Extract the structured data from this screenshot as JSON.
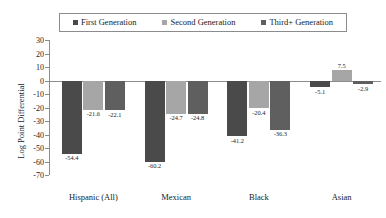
{
  "chart_data": {
    "type": "bar",
    "title": "",
    "xlabel": "",
    "ylabel": "Log Point Differential",
    "ylim": [
      -70,
      30
    ],
    "ytick_step": 10,
    "yticks": [
      30,
      20,
      10,
      0,
      -10,
      -20,
      -30,
      -40,
      -50,
      -60,
      -70
    ],
    "ytick_labels": [
      "30",
      "20",
      "10",
      "0",
      "-10",
      "-20",
      "-30",
      "-40",
      "-50",
      "-60",
      "-70"
    ],
    "categories": [
      "Hispanic (All)",
      "Mexican",
      "Black",
      "Asian"
    ],
    "grid": false,
    "legend_position": "top",
    "series": [
      {
        "name": "First Generation",
        "color": "#4a4a4a",
        "values": [
          -54.4,
          -60.2,
          -41.2,
          -5.1
        ],
        "labels": [
          "-54.4",
          "-60.2",
          "-41.2",
          "-5.1"
        ]
      },
      {
        "name": "Second Generation",
        "color": "#a6a6a6",
        "values": [
          -21.6,
          -24.7,
          -20.4,
          7.5
        ],
        "labels": [
          "-21.6",
          "-24.7",
          "-20.4",
          "7.5"
        ]
      },
      {
        "name": "Third+ Generation",
        "color": "#5f5f5f",
        "values": [
          -22.1,
          -24.8,
          -36.3,
          -2.9
        ],
        "labels": [
          "-22.1",
          "-24.8",
          "-36.3",
          "-2.9"
        ]
      }
    ]
  },
  "colors": {
    "axis": "#8c8c8c",
    "text": "#1a1a1a",
    "background": "#ffffff",
    "series_1": "#4a4a4a",
    "series_2": "#a6a6a6",
    "series_3": "#5f5f5f"
  }
}
